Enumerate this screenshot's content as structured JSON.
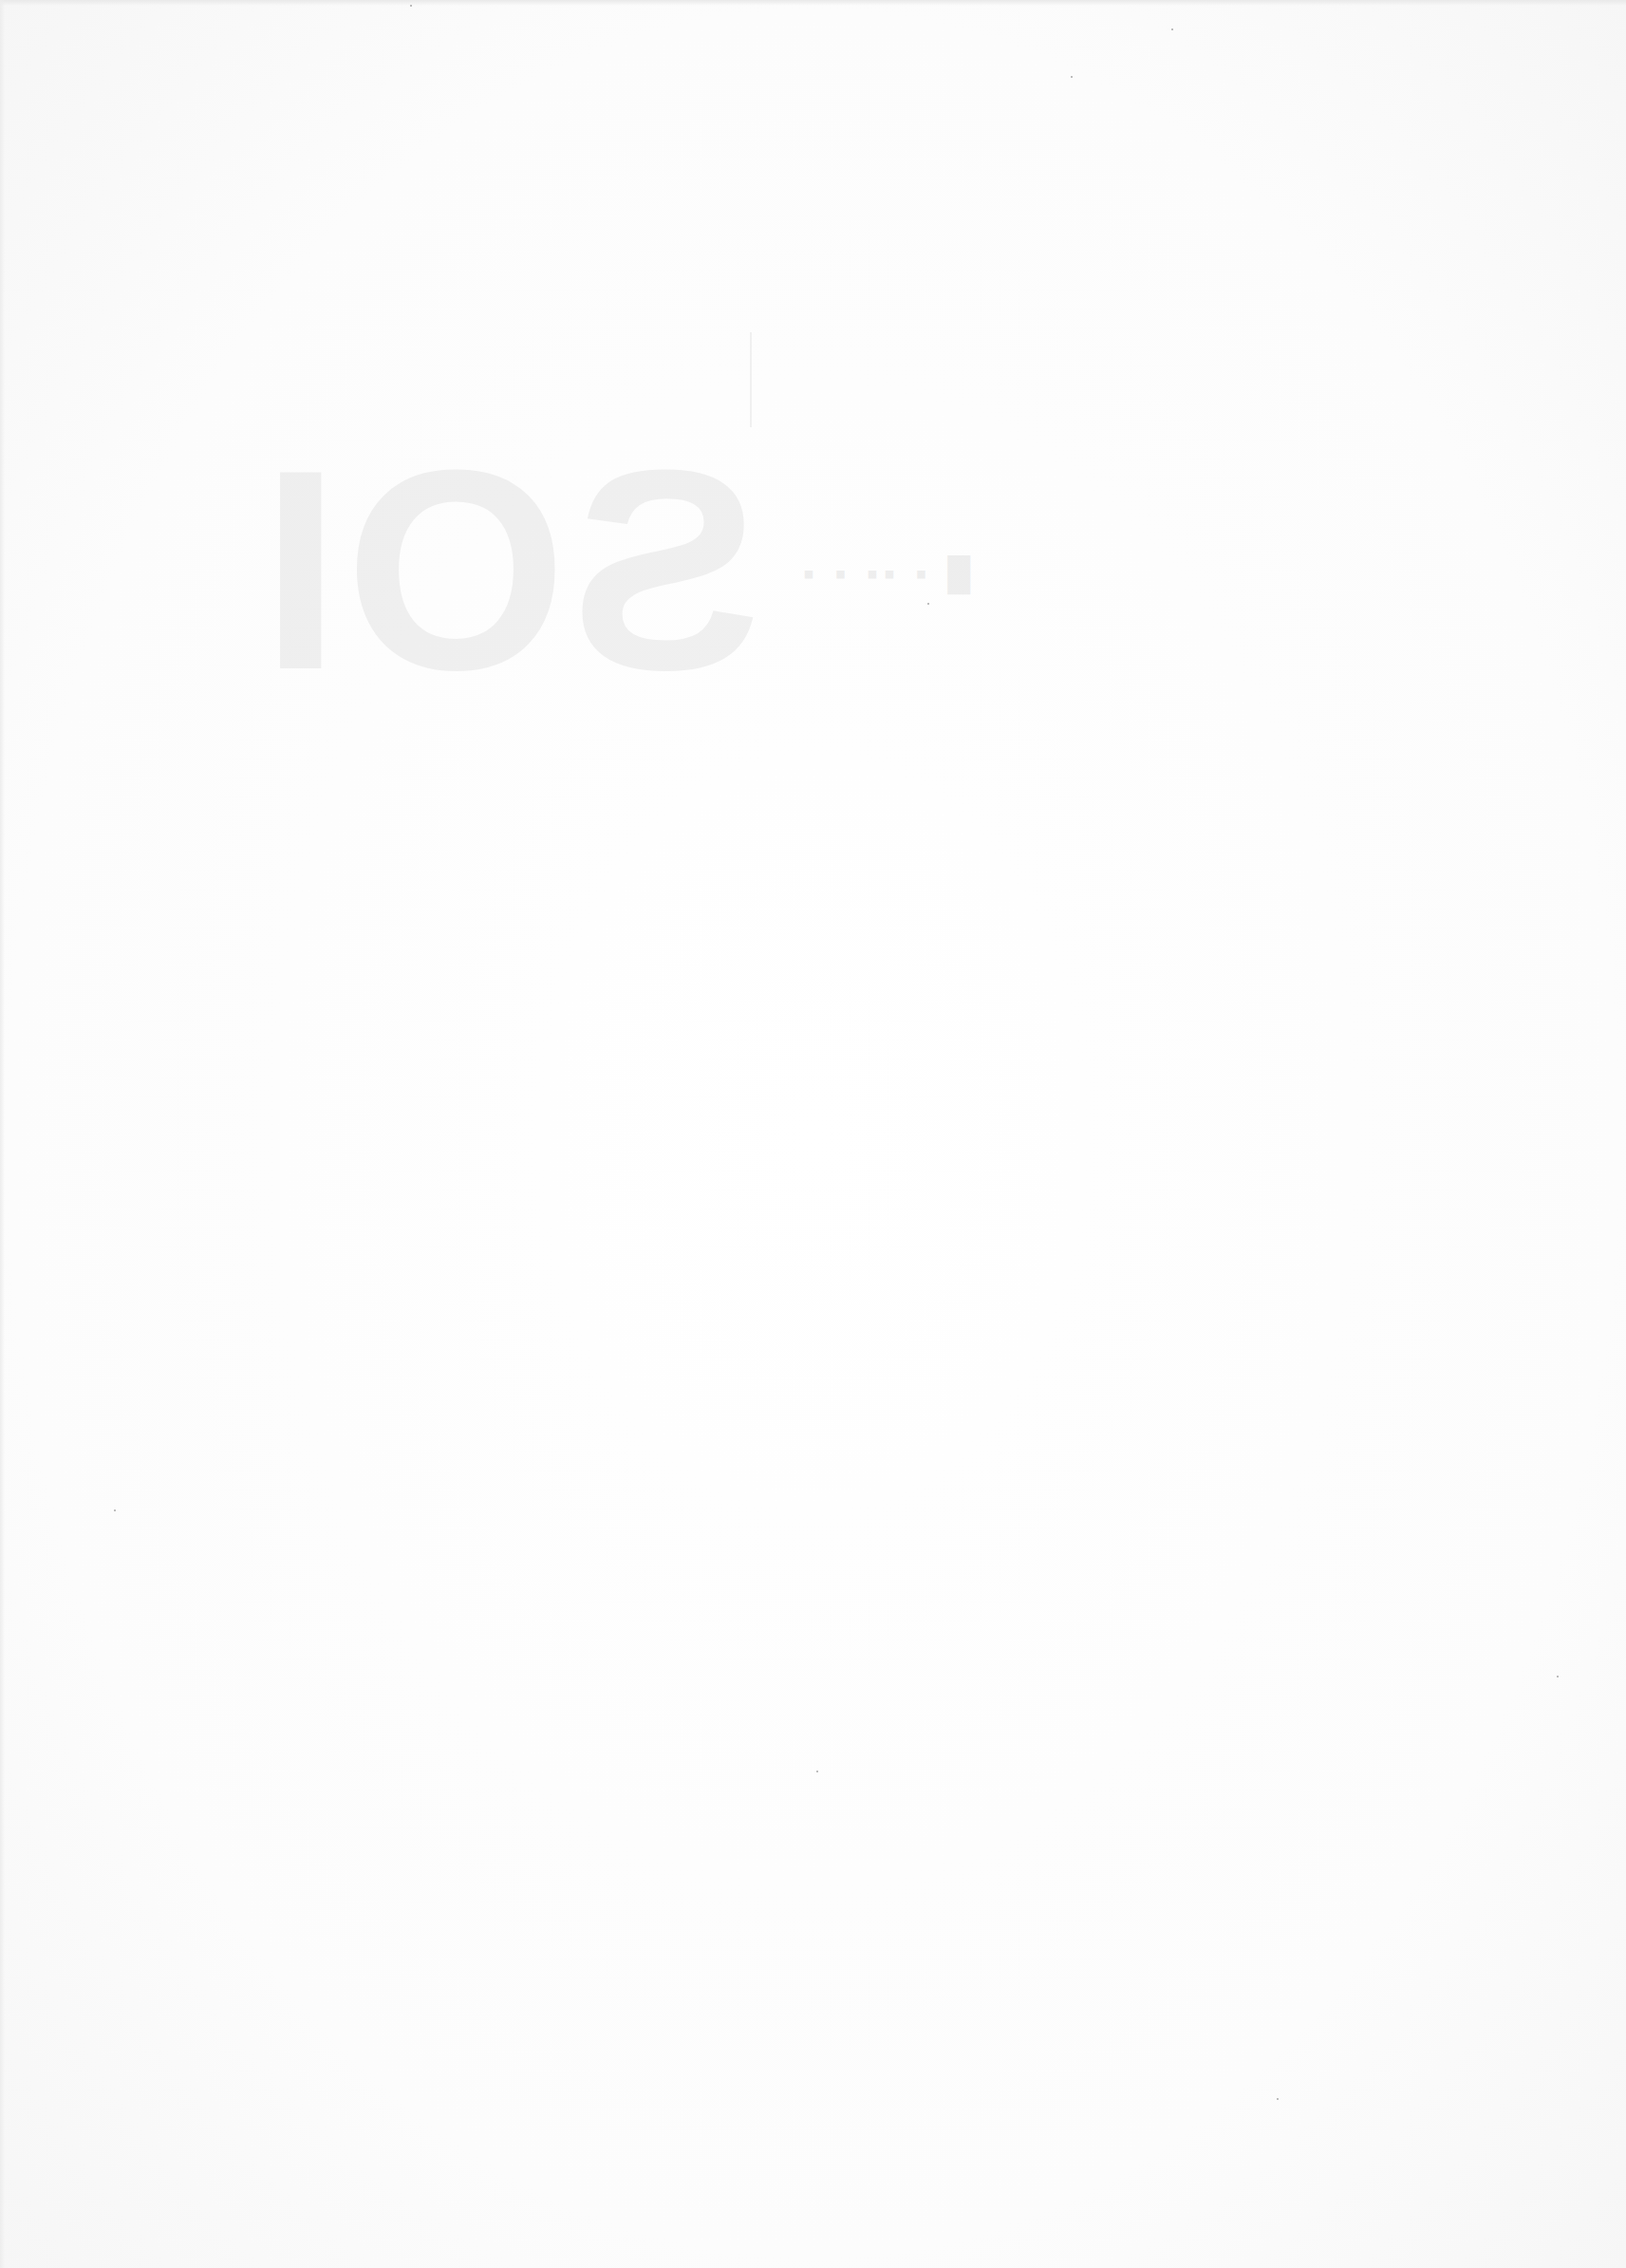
{
  "page": {
    "type": "blank scanned page",
    "background_color": "#fdfdfd",
    "bleed_through_glyphs": "faint mirrored large characters (illegible)",
    "bleed_through_text_line": "faint mirrored small text (illegible)"
  }
}
